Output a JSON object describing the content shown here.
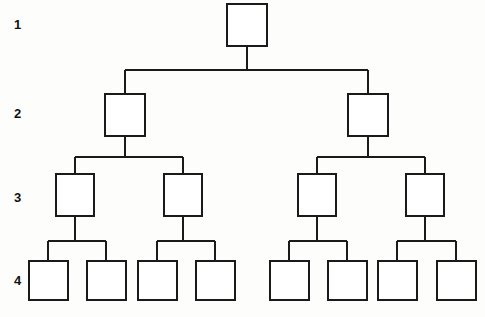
{
  "diagram": {
    "background_color": "#fdfdfc",
    "line_color": "#1a1a1a",
    "node_fill_color": "#ffffff",
    "level_labels": [
      {
        "text": "1",
        "x": 14,
        "y": 18
      },
      {
        "text": "2",
        "x": 14,
        "y": 107
      },
      {
        "text": "3",
        "x": 14,
        "y": 191
      },
      {
        "text": "4",
        "x": 14,
        "y": 274
      }
    ],
    "levels": [
      {
        "level": 1,
        "label": "1",
        "node_count": 1,
        "box_width": 40,
        "box_height": 42,
        "box_top": 4,
        "nodes": [
          {
            "id": "n1",
            "x": 227,
            "y": 4,
            "w": 40,
            "h": 42
          }
        ]
      },
      {
        "level": 2,
        "label": "2",
        "node_count": 2,
        "box_width": 40,
        "box_height": 42,
        "box_top": 94,
        "nodes": [
          {
            "id": "n2a",
            "x": 105,
            "y": 94,
            "w": 40,
            "h": 42
          },
          {
            "id": "n2b",
            "x": 348,
            "y": 94,
            "w": 40,
            "h": 42
          }
        ]
      },
      {
        "level": 3,
        "label": "3",
        "node_count": 4,
        "box_width": 38,
        "box_height": 42,
        "box_top": 174,
        "nodes": [
          {
            "id": "n3a",
            "x": 56,
            "y": 174,
            "w": 38,
            "h": 42
          },
          {
            "id": "n3b",
            "x": 164,
            "y": 174,
            "w": 38,
            "h": 42
          },
          {
            "id": "n3c",
            "x": 298,
            "y": 174,
            "w": 38,
            "h": 42
          },
          {
            "id": "n3d",
            "x": 406,
            "y": 174,
            "w": 38,
            "h": 42
          }
        ]
      },
      {
        "level": 4,
        "label": "4",
        "node_count": 8,
        "box_width": 39,
        "box_height": 39,
        "box_top": 261,
        "nodes": [
          {
            "id": "n4a",
            "x": 29,
            "y": 261,
            "w": 39,
            "h": 39
          },
          {
            "id": "n4b",
            "x": 87,
            "y": 261,
            "w": 39,
            "h": 39
          },
          {
            "id": "n4c",
            "x": 138,
            "y": 261,
            "w": 39,
            "h": 39
          },
          {
            "id": "n4d",
            "x": 196,
            "y": 261,
            "w": 39,
            "h": 39
          },
          {
            "id": "n4e",
            "x": 270,
            "y": 261,
            "w": 39,
            "h": 39
          },
          {
            "id": "n4f",
            "x": 328,
            "y": 261,
            "w": 39,
            "h": 39
          },
          {
            "id": "n4g",
            "x": 378,
            "y": 261,
            "w": 39,
            "h": 39
          },
          {
            "id": "n4h",
            "x": 437,
            "y": 261,
            "w": 39,
            "h": 39
          }
        ]
      }
    ],
    "connectors": {
      "root_stem": {
        "x": 247,
        "y1": 46,
        "y2": 70
      },
      "bus_1_2": {
        "y": 70,
        "x1": 125,
        "x2": 368
      },
      "drops_1_2": [
        {
          "x": 125,
          "y1": 70,
          "y2": 94
        },
        {
          "x": 368,
          "y1": 70,
          "y2": 94
        }
      ],
      "stems_2_3": [
        {
          "x": 125,
          "y1": 136,
          "y2": 157
        },
        {
          "x": 368,
          "y1": 136,
          "y2": 157
        }
      ],
      "buses_2_3": [
        {
          "y": 157,
          "x1": 75,
          "x2": 183
        },
        {
          "y": 157,
          "x1": 317,
          "x2": 425
        }
      ],
      "drops_2_3": [
        {
          "x": 75,
          "y1": 157,
          "y2": 174
        },
        {
          "x": 183,
          "y1": 157,
          "y2": 174
        },
        {
          "x": 317,
          "y1": 157,
          "y2": 174
        },
        {
          "x": 425,
          "y1": 157,
          "y2": 174
        }
      ],
      "stems_3_4": [
        {
          "x": 75,
          "y1": 216,
          "y2": 241
        },
        {
          "x": 183,
          "y1": 216,
          "y2": 241
        },
        {
          "x": 317,
          "y1": 216,
          "y2": 241
        },
        {
          "x": 425,
          "y1": 216,
          "y2": 241
        }
      ],
      "buses_3_4": [
        {
          "y": 241,
          "x1": 48,
          "x2": 106
        },
        {
          "y": 241,
          "x1": 157,
          "x2": 215
        },
        {
          "y": 241,
          "x1": 289,
          "x2": 347
        },
        {
          "y": 241,
          "x1": 397,
          "x2": 456
        }
      ],
      "drops_3_4": [
        {
          "x": 48,
          "y1": 241,
          "y2": 261
        },
        {
          "x": 106,
          "y1": 241,
          "y2": 261
        },
        {
          "x": 157,
          "y1": 241,
          "y2": 261
        },
        {
          "x": 215,
          "y1": 241,
          "y2": 261
        },
        {
          "x": 289,
          "y1": 241,
          "y2": 261
        },
        {
          "x": 347,
          "y1": 241,
          "y2": 261
        },
        {
          "x": 397,
          "y1": 241,
          "y2": 261
        },
        {
          "x": 456,
          "y1": 241,
          "y2": 261
        }
      ]
    }
  }
}
